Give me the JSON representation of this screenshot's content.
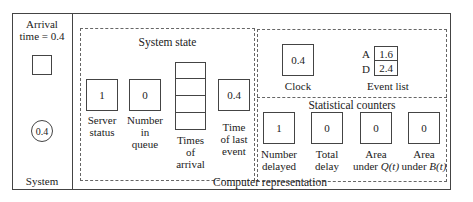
{
  "system_panel": {
    "arrival_label_line1": "Arrival",
    "arrival_label_line2": "time = 0.4",
    "customer_in_queue_shape": "square",
    "customer_in_service_value": "0.4",
    "label": "System"
  },
  "computer_representation": {
    "label": "Computer representation",
    "system_state": {
      "title": "System state",
      "server_status": {
        "value": "1",
        "label_line1": "Server",
        "label_line2": "status"
      },
      "number_in_queue": {
        "value": "0",
        "label_line1": "Number",
        "label_line2": "in",
        "label_line3": "queue"
      },
      "times_of_arrival": {
        "cells": [
          "",
          "",
          "",
          ""
        ],
        "label_line1": "Times",
        "label_line2": "of",
        "label_line3": "arrival"
      },
      "time_of_last_event": {
        "value": "0.4",
        "label_line1": "Time",
        "label_line2": "of last",
        "label_line3": "event"
      }
    },
    "clock": {
      "value": "0.4",
      "label": "Clock"
    },
    "event_list": {
      "label": "Event list",
      "rows": [
        {
          "key": "A",
          "value": "1.6"
        },
        {
          "key": "D",
          "value": "2.4"
        }
      ]
    },
    "statistical_counters": {
      "title": "Statistical counters",
      "items": [
        {
          "value": "1",
          "label_line1": "Number",
          "label_line2": "delayed"
        },
        {
          "value": "0",
          "label_line1": "Total",
          "label_line2": "delay"
        },
        {
          "value": "0",
          "label_line1": "Area",
          "label_line2_prefix": "under ",
          "label_line2_var": "Q(t)"
        },
        {
          "value": "0",
          "label_line1": "Area",
          "label_line2_prefix": "under ",
          "label_line2_var": "B(t)"
        }
      ]
    }
  }
}
